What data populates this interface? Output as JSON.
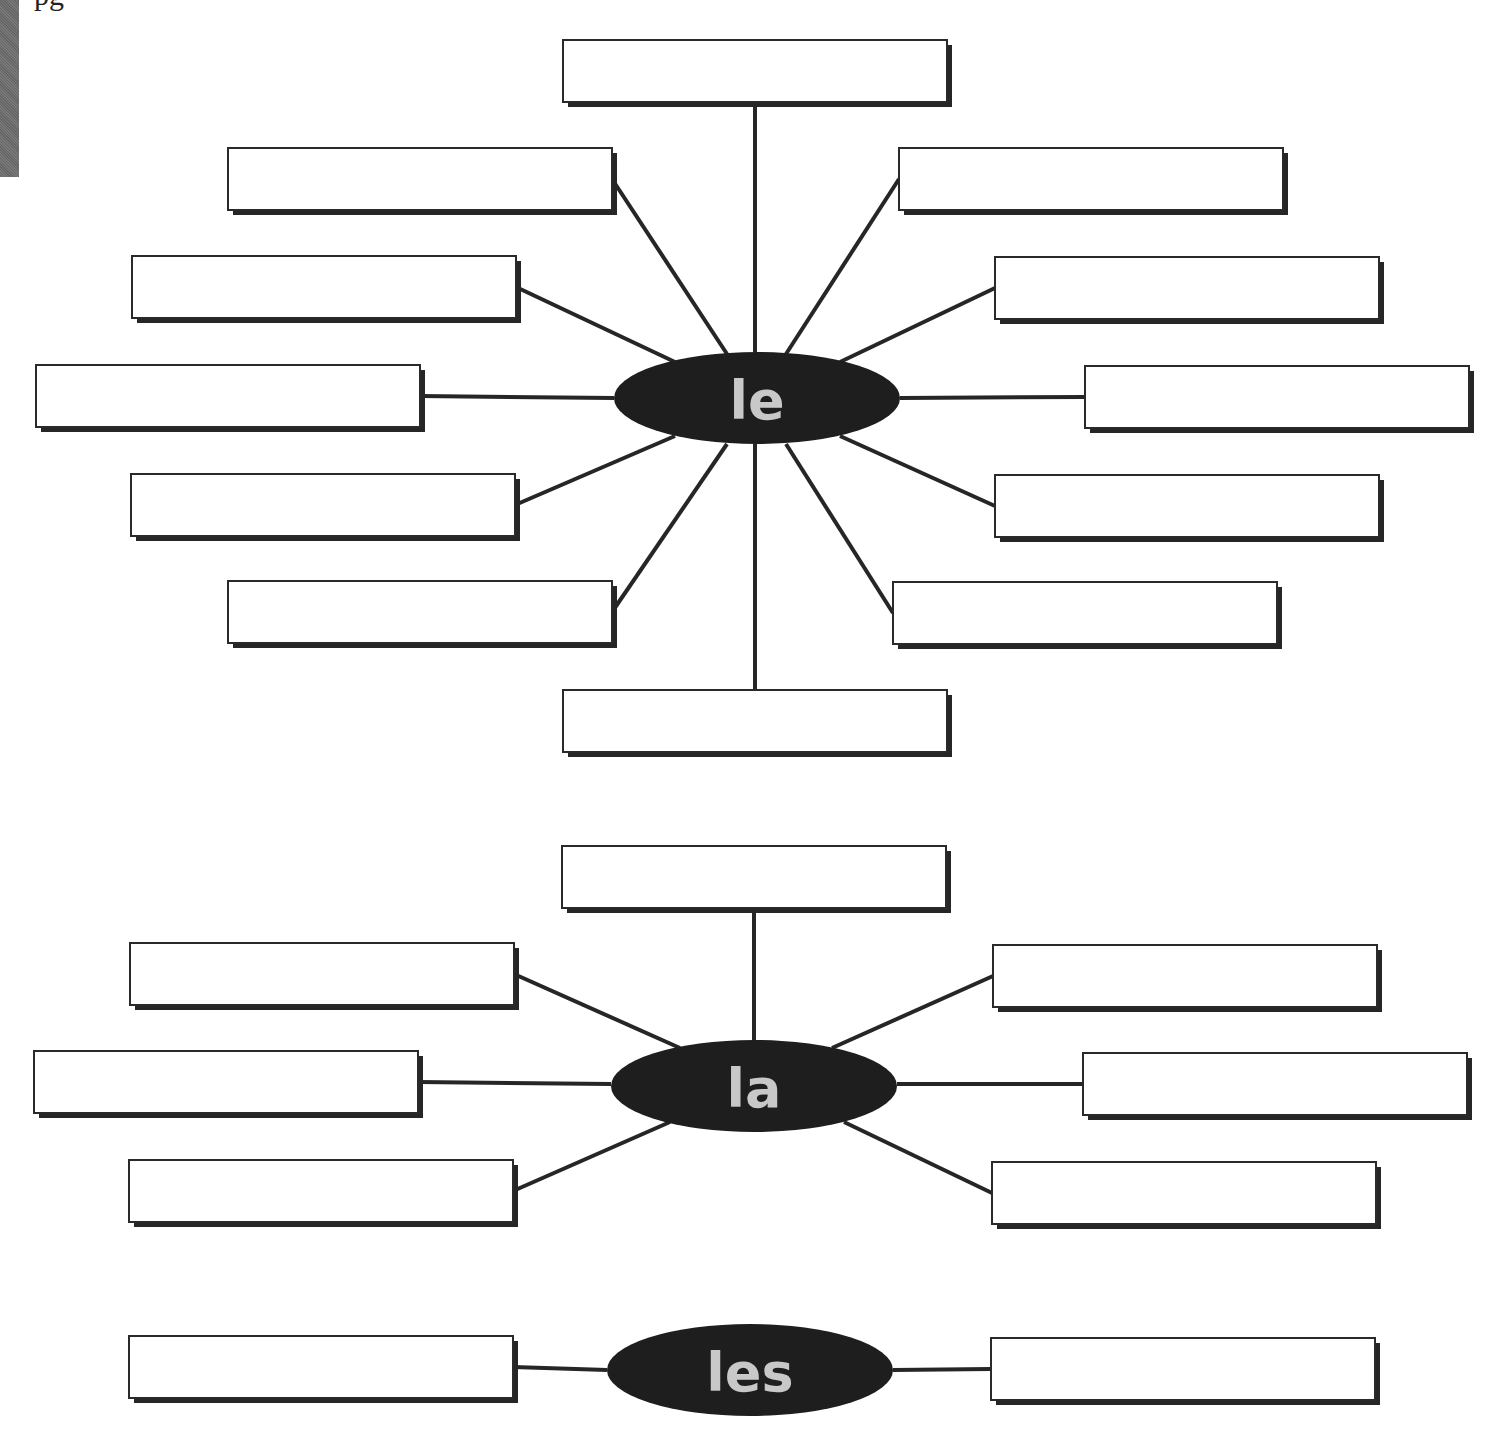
{
  "page": {
    "header_fragment": "pg"
  },
  "webs": [
    {
      "id": "le",
      "hub_label": "le",
      "answer_boxes": [
        "",
        "",
        "",
        "",
        "",
        "",
        "",
        "",
        "",
        "",
        "",
        ""
      ]
    },
    {
      "id": "la",
      "hub_label": "la",
      "answer_boxes": [
        "",
        "",
        "",
        "",
        "",
        ""
      ]
    },
    {
      "id": "les",
      "hub_label": "les",
      "answer_boxes": [
        "",
        ""
      ]
    }
  ],
  "colors": {
    "hub_fill": "#1e1e1e",
    "hub_text": "#c8c8c8",
    "box_border": "#2a2a2a",
    "box_shadow": "#262626",
    "connector": "#262626",
    "side_strip": "#6e6e6e"
  }
}
